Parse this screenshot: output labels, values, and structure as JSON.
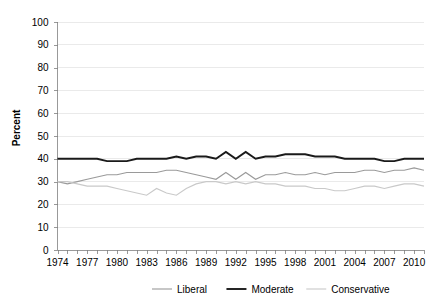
{
  "chart_data": {
    "type": "line",
    "title": "",
    "xlabel": "",
    "ylabel": "Percent",
    "ylim": [
      0,
      100
    ],
    "ytick_step": 10,
    "yticks": [
      "0",
      "10",
      "20",
      "30",
      "40",
      "50",
      "60",
      "70",
      "80",
      "90",
      "100"
    ],
    "xlim": [
      1974,
      2011
    ],
    "xtick_labels": [
      "1974",
      "1977",
      "1980",
      "1983",
      "1986",
      "1989",
      "1992",
      "1995",
      "1998",
      "2001",
      "2004",
      "2007",
      "2010"
    ],
    "xtick_label_step": 3,
    "xtick_minor_step": 1,
    "grid": "horizontal",
    "legend_position": "bottom",
    "x": [
      1974,
      1975,
      1976,
      1977,
      1978,
      1979,
      1980,
      1981,
      1982,
      1983,
      1984,
      1985,
      1986,
      1987,
      1988,
      1989,
      1990,
      1991,
      1992,
      1993,
      1994,
      1995,
      1996,
      1997,
      1998,
      1999,
      2000,
      2001,
      2002,
      2003,
      2004,
      2005,
      2006,
      2007,
      2008,
      2009,
      2010,
      2011
    ],
    "series": [
      {
        "name": "Liberal",
        "color": "#9a9a9a",
        "width": 1.1,
        "values": [
          30,
          29,
          30,
          31,
          32,
          33,
          33,
          34,
          34,
          34,
          34,
          35,
          35,
          34,
          33,
          32,
          31,
          34,
          31,
          34,
          31,
          33,
          33,
          34,
          33,
          33,
          34,
          33,
          34,
          34,
          34,
          35,
          35,
          34,
          35,
          35,
          36,
          35
        ]
      },
      {
        "name": "Moderate",
        "color": "#1a1a1a",
        "width": 1.9,
        "values": [
          40,
          40,
          40,
          40,
          40,
          39,
          39,
          39,
          40,
          40,
          40,
          40,
          41,
          40,
          41,
          41,
          40,
          43,
          40,
          43,
          40,
          41,
          41,
          42,
          42,
          42,
          41,
          41,
          41,
          40,
          40,
          40,
          40,
          39,
          39,
          40,
          40,
          40
        ]
      },
      {
        "name": "Conservative",
        "color": "#c9c9c9",
        "width": 1.1,
        "values": [
          30,
          30,
          29,
          28,
          28,
          28,
          27,
          26,
          25,
          24,
          27,
          25,
          24,
          27,
          29,
          30,
          30,
          29,
          30,
          29,
          30,
          29,
          29,
          28,
          28,
          28,
          27,
          27,
          26,
          26,
          27,
          28,
          28,
          27,
          28,
          29,
          29,
          28
        ]
      }
    ]
  },
  "legend": {
    "items": [
      {
        "label": "Liberal",
        "color": "#9a9a9a",
        "width": 1.1
      },
      {
        "label": "Moderate",
        "color": "#1a1a1a",
        "width": 1.9
      },
      {
        "label": "Conservative",
        "color": "#c9c9c9",
        "width": 1.1
      }
    ]
  },
  "style": {
    "gridline_color": "#dcdcdc",
    "axis_color": "#808080",
    "text_color": "#000000",
    "background": "#ffffff"
  }
}
